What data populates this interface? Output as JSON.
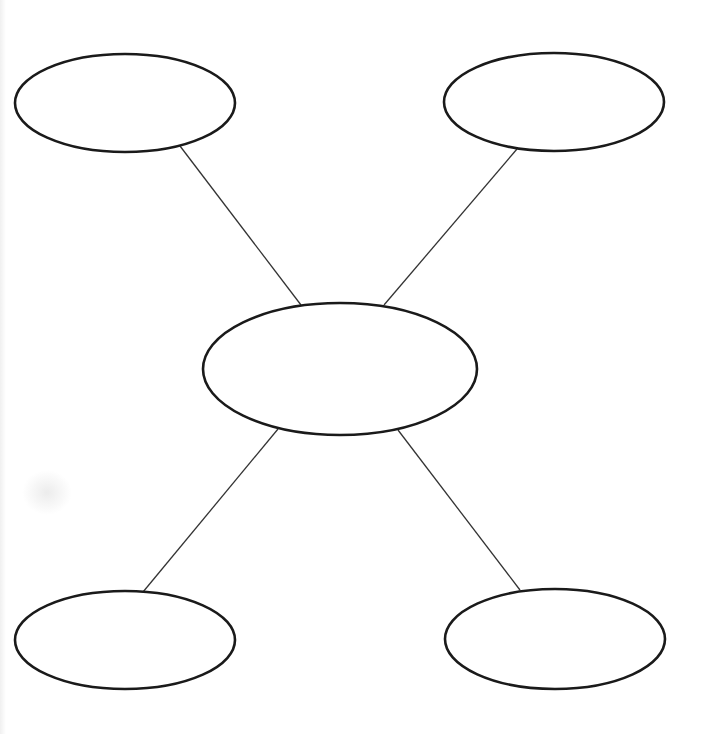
{
  "diagram": {
    "type": "spider-map",
    "stroke_color": "#1a1a1a",
    "line_color": "#333333",
    "background": "#ffffff",
    "nodes": [
      {
        "id": "center",
        "label": "",
        "cx": 340,
        "cy": 369,
        "rx": 137,
        "ry": 66
      },
      {
        "id": "top-left",
        "label": "",
        "cx": 125,
        "cy": 103,
        "rx": 110,
        "ry": 49
      },
      {
        "id": "top-right",
        "label": "",
        "cx": 554,
        "cy": 102,
        "rx": 110,
        "ry": 49
      },
      {
        "id": "bottom-left",
        "label": "",
        "cx": 125,
        "cy": 640,
        "rx": 110,
        "ry": 49
      },
      {
        "id": "bottom-right",
        "label": "",
        "cx": 555,
        "cy": 639,
        "rx": 110,
        "ry": 50
      }
    ],
    "edges": [
      {
        "from": "top-left",
        "to": "center",
        "x1": 180,
        "y1": 146,
        "x2": 301,
        "y2": 305
      },
      {
        "from": "top-right",
        "to": "center",
        "x1": 517,
        "y1": 149,
        "x2": 384,
        "y2": 305
      },
      {
        "from": "center",
        "to": "bottom-left",
        "x1": 278,
        "y1": 429,
        "x2": 143,
        "y2": 592
      },
      {
        "from": "center",
        "to": "bottom-right",
        "x1": 398,
        "y1": 430,
        "x2": 520,
        "y2": 590
      }
    ]
  }
}
